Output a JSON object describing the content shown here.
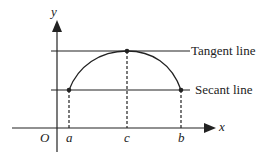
{
  "diagram": {
    "axes": {
      "x_label": "x",
      "y_label": "y",
      "origin_label": "O"
    },
    "points": [
      {
        "label": "a"
      },
      {
        "label": "c"
      },
      {
        "label": "b"
      }
    ],
    "lines": {
      "tangent_label": "Tangent line",
      "secant_label": "Secant line"
    },
    "colors": {
      "stroke": "#222222"
    }
  }
}
